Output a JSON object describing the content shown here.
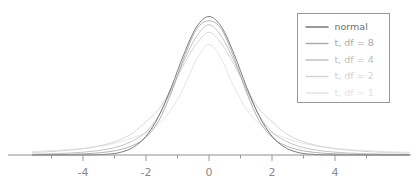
{
  "chart_data": {
    "type": "line",
    "title": "",
    "xlabel": "",
    "ylabel": "",
    "xlim": [
      -5.6,
      6.35
    ],
    "ylim": [
      0,
      0.42
    ],
    "grid": false,
    "xticks_major": [
      -4,
      -2,
      0,
      2,
      4
    ],
    "xtick_labels": [
      "-4",
      "-2",
      "0",
      "2",
      "4"
    ],
    "xticks_minor": [
      -5,
      -3,
      -1,
      1,
      3,
      5
    ],
    "legend": {
      "position": "upper right",
      "border_color": "#9a9a9a",
      "background": "#ffffff",
      "entries": [
        {
          "label": "normal",
          "color": "#6e6e6e",
          "df": null
        },
        {
          "label": "t, df = 8",
          "color": "#a9a9a9",
          "df": 8
        },
        {
          "label": "t, df = 4",
          "color": "#bdbdbd",
          "df": 4
        },
        {
          "label": "t, df = 2",
          "color": "#d2d2d2",
          "df": 2
        },
        {
          "label": "t, df = 1",
          "color": "#e2e2e2",
          "df": 1
        }
      ]
    },
    "series": [
      {
        "name": "normal",
        "color": "#6e6e6e",
        "peak_density": 0.3989,
        "x": [
          -5.6,
          -5.2,
          -4.8,
          -4.4,
          -4.0,
          -3.6,
          -3.2,
          -2.8,
          -2.4,
          -2.0,
          -1.6,
          -1.2,
          -0.8,
          -0.4,
          0.0,
          0.4,
          0.8,
          1.2,
          1.6,
          2.0,
          2.4,
          2.8,
          3.2,
          3.6,
          4.0,
          4.4,
          4.8,
          5.2,
          5.6,
          6.0,
          6.35
        ],
        "values": [
          0.0,
          0.0,
          0.0,
          0.0,
          0.0001,
          0.0006,
          0.0024,
          0.0079,
          0.0224,
          0.054,
          0.1109,
          0.1942,
          0.2897,
          0.3683,
          0.3989,
          0.3683,
          0.2897,
          0.1942,
          0.1109,
          0.054,
          0.0224,
          0.0079,
          0.0024,
          0.0006,
          0.0001,
          0.0,
          0.0,
          0.0,
          0.0,
          0.0,
          0.0
        ]
      },
      {
        "name": "t, df = 8",
        "color": "#a9a9a9",
        "peak_density": 0.3867,
        "x": [
          -5.6,
          -5.2,
          -4.8,
          -4.4,
          -4.0,
          -3.6,
          -3.2,
          -2.8,
          -2.4,
          -2.0,
          -1.6,
          -1.2,
          -0.8,
          -0.4,
          0.0,
          0.4,
          0.8,
          1.2,
          1.6,
          2.0,
          2.4,
          2.8,
          3.2,
          3.6,
          4.0,
          4.4,
          4.8,
          5.2,
          5.6,
          6.0,
          6.35
        ],
        "values": [
          0.0006,
          0.0009,
          0.0013,
          0.0021,
          0.0033,
          0.0054,
          0.0091,
          0.0158,
          0.0283,
          0.051,
          0.0977,
          0.1786,
          0.2788,
          0.3614,
          0.3867,
          0.3614,
          0.2788,
          0.1786,
          0.0977,
          0.051,
          0.0283,
          0.0158,
          0.0091,
          0.0054,
          0.0033,
          0.0021,
          0.0013,
          0.0009,
          0.0006,
          0.0004,
          0.0003
        ]
      },
      {
        "name": "t, df = 4",
        "color": "#bdbdbd",
        "peak_density": 0.375,
        "x": [
          -5.6,
          -5.2,
          -4.8,
          -4.4,
          -4.0,
          -3.6,
          -3.2,
          -2.8,
          -2.4,
          -2.0,
          -1.6,
          -1.2,
          -0.8,
          -0.4,
          0.0,
          0.4,
          0.8,
          1.2,
          1.6,
          2.0,
          2.4,
          2.8,
          3.2,
          3.6,
          4.0,
          4.4,
          4.8,
          5.2,
          5.6,
          6.0,
          6.35
        ],
        "values": [
          0.0024,
          0.0032,
          0.0042,
          0.0058,
          0.0081,
          0.0117,
          0.0173,
          0.0265,
          0.0418,
          0.0663,
          0.1127,
          0.1868,
          0.27,
          0.341,
          0.375,
          0.341,
          0.27,
          0.1868,
          0.1127,
          0.0663,
          0.0418,
          0.0265,
          0.0173,
          0.0117,
          0.0081,
          0.0058,
          0.0042,
          0.0032,
          0.0024,
          0.0018,
          0.0015
        ]
      },
      {
        "name": "t, df = 2",
        "color": "#d2d2d2",
        "peak_density": 0.3536,
        "x": [
          -5.6,
          -5.2,
          -4.8,
          -4.4,
          -4.0,
          -3.6,
          -3.2,
          -2.8,
          -2.4,
          -2.0,
          -1.6,
          -1.2,
          -0.8,
          -0.4,
          0.0,
          0.4,
          0.8,
          1.2,
          1.6,
          2.0,
          2.4,
          2.8,
          3.2,
          3.6,
          4.0,
          4.4,
          4.8,
          5.2,
          5.6,
          6.0,
          6.35
        ],
        "values": [
          0.0072,
          0.0089,
          0.0111,
          0.0141,
          0.0182,
          0.024,
          0.0324,
          0.045,
          0.0643,
          0.0962,
          0.1312,
          0.1903,
          0.26,
          0.32,
          0.3536,
          0.32,
          0.26,
          0.1903,
          0.1312,
          0.0962,
          0.0643,
          0.045,
          0.0324,
          0.024,
          0.0182,
          0.0141,
          0.0111,
          0.0089,
          0.0072,
          0.0059,
          0.0051
        ]
      },
      {
        "name": "t, df = 1",
        "color": "#e2e2e2",
        "peak_density": 0.3183,
        "x": [
          -5.6,
          -5.2,
          -4.8,
          -4.4,
          -4.0,
          -3.6,
          -3.2,
          -2.8,
          -2.4,
          -2.0,
          -1.6,
          -1.2,
          -0.8,
          -0.4,
          0.0,
          0.4,
          0.8,
          1.2,
          1.6,
          2.0,
          2.4,
          2.8,
          3.2,
          3.6,
          4.0,
          4.4,
          4.8,
          5.2,
          5.6,
          6.0,
          6.35
        ],
        "values": [
          0.01,
          0.0116,
          0.0135,
          0.016,
          0.0187,
          0.0234,
          0.0296,
          0.0382,
          0.0505,
          0.0637,
          0.0895,
          0.1304,
          0.1941,
          0.2744,
          0.3183,
          0.2744,
          0.1941,
          0.1304,
          0.0895,
          0.0637,
          0.0505,
          0.0382,
          0.0296,
          0.0234,
          0.0187,
          0.016,
          0.0135,
          0.0116,
          0.01,
          0.0086,
          0.0078
        ]
      }
    ],
    "axis": {
      "color": "#8f8f8f",
      "tick_color": "#9a9a9a"
    }
  }
}
